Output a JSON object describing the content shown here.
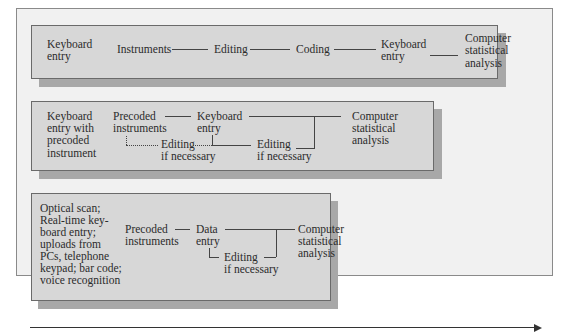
{
  "diagram": {
    "outer_panel_color": "#f1f1f1",
    "box_color": "#d7d7d7",
    "shadow_color": "#a8a8a8",
    "rows": [
      {
        "method": "Keyboard entry",
        "method_lines": [
          "Keyboard",
          "entry"
        ],
        "steps": [
          {
            "label": "Instruments"
          },
          {
            "label": "Editing"
          },
          {
            "label": "Coding"
          },
          {
            "label_lines": [
              "Keyboard",
              "entry"
            ]
          },
          {
            "label_lines": [
              "Computer",
              "statistical",
              "analysis"
            ]
          }
        ]
      },
      {
        "method": "Keyboard entry with precoded instrument",
        "method_lines": [
          "Keyboard",
          "entry with",
          "precoded",
          "instrument"
        ],
        "steps": [
          {
            "label_lines": [
              "Precoded",
              "instruments"
            ]
          },
          {
            "label_lines": [
              "Editing",
              "if necessary"
            ],
            "connector": "dotted"
          },
          {
            "label_lines": [
              "Keyboard",
              "entry"
            ]
          },
          {
            "label_lines": [
              "Editing",
              "if necessary"
            ]
          },
          {
            "label_lines": [
              "Computer",
              "statistical",
              "analysis"
            ]
          }
        ]
      },
      {
        "method": "Optical scan; Real-time keyboard entry; uploads from PCs, telephone keypad; bar code; voice recognition",
        "method_lines": [
          "Optical scan;",
          "Real-time key-",
          "board entry;",
          "uploads from",
          "PCs, telephone",
          "keypad; bar code;",
          "voice recognition"
        ],
        "steps": [
          {
            "label_lines": [
              "Precoded",
              "instruments"
            ]
          },
          {
            "label_lines": [
              "Data",
              "entry"
            ]
          },
          {
            "label_lines": [
              "Editing",
              "if necessary"
            ]
          },
          {
            "label_lines": [
              "Computer",
              "statistical",
              "analysis"
            ]
          }
        ]
      }
    ],
    "timeline_arrow": "right-arrow"
  }
}
